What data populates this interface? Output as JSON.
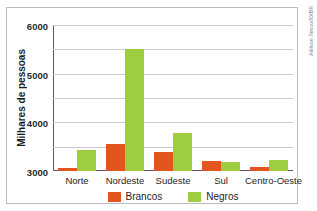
{
  "figure": {
    "caption_strip": "",
    "credit": "Adilson Secco/ID/BR"
  },
  "chart_data": {
    "type": "bar",
    "title": "",
    "xlabel": "",
    "ylabel": "Milhares de pessoas",
    "categories": [
      "Norte",
      "Nordeste",
      "Sudeste",
      "Sul",
      "Centro-Oeste"
    ],
    "series": [
      {
        "name": "Brancos",
        "color": "#e2551f",
        "values": [
          130,
          1090,
          790,
          430,
          160
        ]
      },
      {
        "name": "Negros",
        "color": "#9fcd42",
        "values": [
          880,
          5030,
          1570,
          375,
          470
        ]
      }
    ],
    "ylim": [
      0,
      6000
    ],
    "yticks": [
      0,
      1000,
      2000,
      3000,
      4000,
      5000,
      6000
    ],
    "ytick_labels": [
      "0",
      "1000",
      "2000",
      "3000",
      "4000",
      "5000",
      "6000"
    ],
    "grid": true,
    "legend_position": "bottom"
  }
}
